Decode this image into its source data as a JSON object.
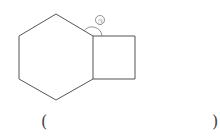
{
  "figure": {
    "shapes": [
      "regular-hexagon",
      "square"
    ],
    "angle_label": "㉠",
    "stroke_color": "#555555"
  },
  "answer": {
    "open_paren": "(",
    "close_paren": ")",
    "value": ""
  }
}
